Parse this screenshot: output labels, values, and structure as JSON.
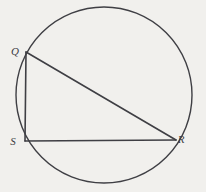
{
  "figure": {
    "name": "circle-with-inscribed-triangle",
    "background_color": "#f1f0ed",
    "stroke_color": "#3f3f44",
    "label_color": "#3b3b3f",
    "circle": {
      "center_x": 104,
      "center_y": 95,
      "radius": 88,
      "stroke_width": 1.4
    },
    "triangle": {
      "stroke_width": 1.6,
      "vertices": [
        {
          "id": "Q",
          "x": 26,
          "y": 52
        },
        {
          "id": "S",
          "x": 25,
          "y": 141
        },
        {
          "id": "R",
          "x": 176,
          "y": 140
        }
      ],
      "sides": [
        {
          "name": "QS",
          "from": "Q",
          "to": "S"
        },
        {
          "name": "SR",
          "from": "S",
          "to": "R"
        },
        {
          "name": "QR",
          "from": "Q",
          "to": "R"
        }
      ]
    },
    "labels": [
      {
        "id": "label-q",
        "text": "Q",
        "x": 15,
        "y": 55
      },
      {
        "id": "label-s",
        "text": "S",
        "x": 13,
        "y": 145
      },
      {
        "id": "label-r",
        "text": "R",
        "x": 181,
        "y": 143
      }
    ]
  }
}
